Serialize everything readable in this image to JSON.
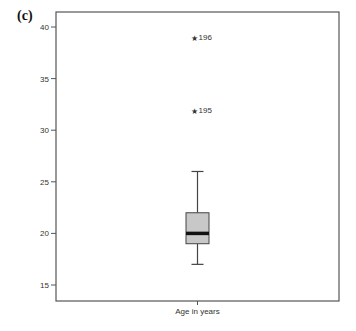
{
  "panel_label": "(c)",
  "chart_data": {
    "type": "box",
    "title": "",
    "xlabel": "",
    "ylabel": "",
    "categories": [
      "Age in years"
    ],
    "ylim": [
      14,
      41.5
    ],
    "yticks": [
      15,
      20,
      25,
      30,
      35,
      40
    ],
    "grid": false,
    "legend": null,
    "series": [
      {
        "name": "Age in years",
        "whisker_low": 17,
        "q1": 19,
        "median": 20,
        "q3": 22,
        "whisker_high": 26,
        "outliers": [
          {
            "value": 39,
            "label": "196",
            "marker": "star"
          },
          {
            "value": 32,
            "label": "195",
            "marker": "star"
          }
        ]
      }
    ],
    "colors": {
      "box_fill": "#c8c8c8",
      "median": "#111111",
      "frame": "#555555"
    }
  }
}
